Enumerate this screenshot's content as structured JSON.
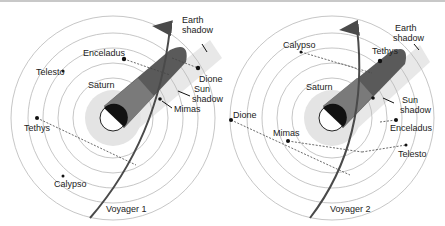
{
  "colors": {
    "ring": "#b8b8b8",
    "halo": "#e6e6e6",
    "trajectory": "#4a4a4a",
    "shadow_dark": "#5a5a5a",
    "shadow_mid": "#7a7a7a",
    "planet_dark": "#111111",
    "text": "#222222"
  },
  "panels": [
    {
      "spacecraft": "Voyager 1",
      "planet": "Saturn",
      "labels": {
        "earth_shadow_1": "Earth",
        "earth_shadow_2": "shadow",
        "sun_shadow_1": "Sun",
        "sun_shadow_2": "shadow"
      },
      "moons": [
        "Enceladus",
        "Telesto",
        "Dione",
        "Mimas",
        "Tethys",
        "Calypso"
      ]
    },
    {
      "spacecraft": "Voyager 2",
      "planet": "Saturn",
      "labels": {
        "earth_shadow_1": "Earth",
        "earth_shadow_2": "shadow",
        "sun_shadow_1": "Sun",
        "sun_shadow_2": "shadow"
      },
      "moons": [
        "Calypso",
        "Tethys",
        "Dione",
        "Mimas",
        "Enceladus",
        "Telesto"
      ]
    }
  ]
}
